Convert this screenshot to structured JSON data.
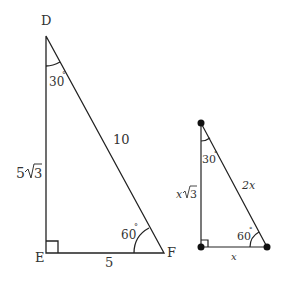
{
  "diagram": {
    "colors": {
      "stroke": "#222222",
      "text": "#333333",
      "background": "#ffffff"
    },
    "large_triangle": {
      "vertices": {
        "top": "D",
        "right_angle": "E",
        "right": "F"
      },
      "angles": {
        "D": "30°",
        "F": "60°",
        "E": "90°"
      },
      "sides": {
        "DE": "5√3",
        "DF": "10",
        "EF": "5"
      }
    },
    "small_triangle": {
      "vertices_marked_with_dots": true,
      "angles": {
        "top": "30°",
        "bottom_right": "60°",
        "bottom_left": "90°"
      },
      "sides": {
        "vertical": "x√3",
        "hypotenuse": "2x",
        "base": "x"
      }
    }
  },
  "labels": {
    "D": "D",
    "E": "E",
    "F": "F",
    "angle_D": "30",
    "angle_F": "60",
    "side_DE_coef": "5",
    "side_DE_rad": "3",
    "side_DF": "10",
    "side_EF": "5",
    "small_angle_top": "30",
    "small_angle_right": "60",
    "small_vertical_coef": "x",
    "small_vertical_rad": "3",
    "small_hyp": "2x",
    "small_base": "x",
    "degree": "°"
  }
}
